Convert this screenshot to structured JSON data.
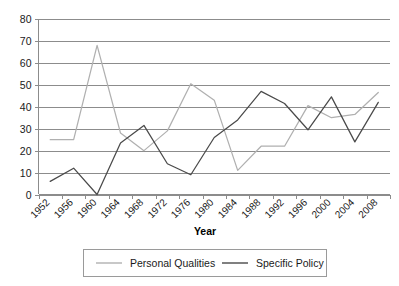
{
  "chart_data": {
    "type": "line",
    "title": "",
    "xlabel": "Year",
    "ylabel": "",
    "categories": [
      "1952",
      "1956",
      "1960",
      "1964",
      "1968",
      "1972",
      "1976",
      "1980",
      "1984",
      "1988",
      "1992",
      "1996",
      "2000",
      "2004",
      "2008"
    ],
    "ylim": [
      0,
      80
    ],
    "yticks": [
      0,
      10,
      20,
      30,
      40,
      50,
      60,
      70,
      80
    ],
    "grid": "horizontal",
    "legend_position": "bottom",
    "series": [
      {
        "name": "Personal Qualities",
        "color": "#b0b0b0",
        "values": [
          25,
          25,
          68,
          28,
          20,
          29,
          50.5,
          43,
          11,
          22,
          22,
          40.5,
          35,
          36.5,
          46.5
        ]
      },
      {
        "name": "Specific Policy",
        "color": "#4a4a4a",
        "values": [
          6,
          12,
          0,
          23.5,
          31.5,
          14,
          9,
          26,
          34,
          47,
          41.5,
          29.5,
          44.5,
          24,
          42
        ]
      }
    ]
  },
  "axes": {
    "y_tick_labels": [
      "80",
      "70",
      "60",
      "50",
      "40",
      "30",
      "20",
      "10",
      "0"
    ],
    "x_tick_labels": [
      "1952",
      "1956",
      "1960",
      "1964",
      "1968",
      "1972",
      "1976",
      "1980",
      "1984",
      "1988",
      "1992",
      "1996",
      "2000",
      "2004",
      "2008"
    ],
    "x_axis_title": "Year"
  },
  "legend": {
    "entries": [
      {
        "label": "Personal Qualities",
        "color": "#b0b0b0"
      },
      {
        "label": "Specific Policy",
        "color": "#4a4a4a"
      }
    ]
  }
}
